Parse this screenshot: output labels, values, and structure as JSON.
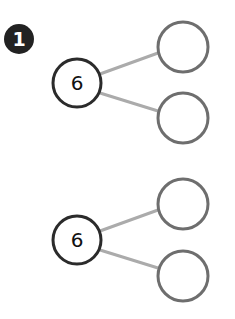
{
  "problem": {
    "number": "1",
    "badge_color": "#222222"
  },
  "colors": {
    "whole_stroke": "#2b2b2b",
    "part_stroke": "#6e6e6e",
    "connector": "#ababab",
    "background": "#ffffff"
  },
  "bonds": [
    {
      "whole": {
        "value": "6",
        "cx": 77,
        "cy": 83,
        "r": 24
      },
      "parts": [
        {
          "value": "",
          "cx": 183,
          "cy": 47,
          "r": 25
        },
        {
          "value": "",
          "cx": 183,
          "cy": 118,
          "r": 25
        }
      ]
    },
    {
      "whole": {
        "value": "6",
        "cx": 77,
        "cy": 240,
        "r": 24
      },
      "parts": [
        {
          "value": "",
          "cx": 183,
          "cy": 204,
          "r": 25
        },
        {
          "value": "",
          "cx": 183,
          "cy": 276,
          "r": 25
        }
      ]
    }
  ]
}
